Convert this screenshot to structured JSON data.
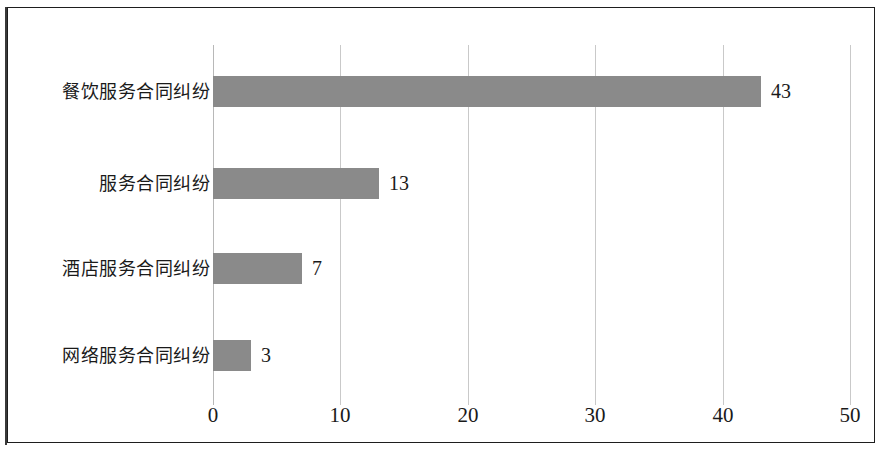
{
  "chart_data": {
    "type": "bar",
    "orientation": "horizontal",
    "title": "",
    "subtitle": "",
    "xlabel": "",
    "ylabel": "",
    "categories": [
      "餐饮服务合同纠纷",
      "服务合同纠纷",
      "酒店服务合同纠纷",
      "网络服务合同纠纷"
    ],
    "values": [
      43,
      13,
      7,
      3
    ],
    "value_labels": [
      "43",
      "13",
      "7",
      "3"
    ],
    "xlim": [
      0,
      50
    ],
    "xticks": [
      0,
      10,
      20,
      30,
      40,
      50
    ],
    "xtick_labels": [
      "0",
      "10",
      "20",
      "30",
      "40",
      "50"
    ],
    "grid": true,
    "grid_axis": "x",
    "legend": false,
    "legend_position": "none",
    "bar_color": "#8a8a8a",
    "gridline_color": "#c9c9c9",
    "axis_color": "#b8b8b8",
    "text_color": "#1a1a1a",
    "frame_color": "#1e1e1e",
    "background_color": "#ffffff"
  },
  "layout": {
    "plot_left_px": 213,
    "plot_right_px": 850,
    "px_per_unit": 12.74,
    "bar_height_px": 31,
    "bar_tops_px": [
      76,
      168,
      253,
      340
    ],
    "grid_top_px": 45,
    "grid_bottom_px": 405
  }
}
